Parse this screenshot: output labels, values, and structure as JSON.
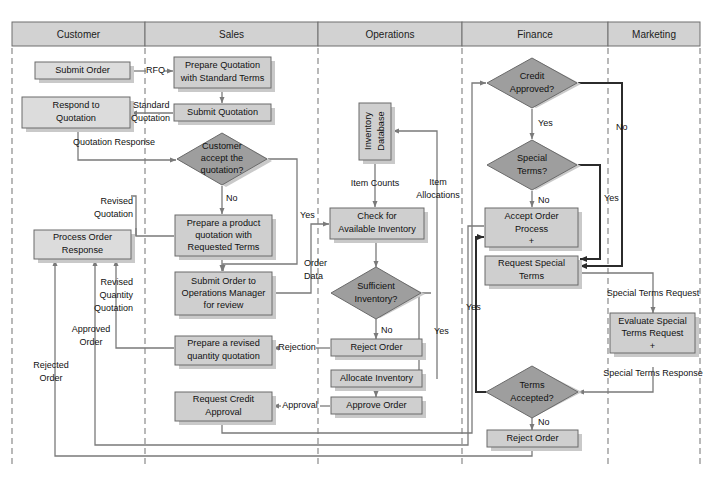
{
  "diagram": {
    "type": "swimlane-flowchart",
    "colors": {
      "lane_header_fill": "#d2d2d2",
      "process_fill": "#cfcfcf",
      "decision_fill": "#9e9e9e",
      "line": "#7a7a7a",
      "line_dark": "#2b2b2b",
      "text": "#111111"
    },
    "lanes": [
      {
        "id": "customer",
        "label": "Customer"
      },
      {
        "id": "sales",
        "label": "Sales"
      },
      {
        "id": "operations",
        "label": "Operations"
      },
      {
        "id": "finance",
        "label": "Finance"
      },
      {
        "id": "marketing",
        "label": "Marketing"
      }
    ],
    "nodes": {
      "submit_order": {
        "lane": "customer",
        "shape": "process",
        "lines": [
          "Submit Order"
        ]
      },
      "respond_quotation": {
        "lane": "customer",
        "shape": "process",
        "lines": [
          "Respond to",
          "Quotation"
        ]
      },
      "process_order_resp": {
        "lane": "customer",
        "shape": "process",
        "lines": [
          "Process Order",
          "Response"
        ]
      },
      "prepare_quotation": {
        "lane": "sales",
        "shape": "process",
        "lines": [
          "Prepare Quotation",
          "with Standard Terms"
        ]
      },
      "submit_quotation": {
        "lane": "sales",
        "shape": "process",
        "lines": [
          "Submit Quotation"
        ]
      },
      "customer_accept": {
        "lane": "sales",
        "shape": "decision",
        "lines": [
          "Customer",
          "accept the",
          "quotation?"
        ]
      },
      "prepare_product_q": {
        "lane": "sales",
        "shape": "process",
        "lines": [
          "Prepare a product",
          "quotation with",
          "Requested Terms"
        ]
      },
      "submit_order_ops": {
        "lane": "sales",
        "shape": "process",
        "lines": [
          "Submit Order to",
          "Operations Manager",
          "for review"
        ]
      },
      "prepare_revised_q": {
        "lane": "sales",
        "shape": "process",
        "lines": [
          "Prepare a revised",
          "quantity quotation"
        ]
      },
      "request_credit": {
        "lane": "sales",
        "shape": "process",
        "lines": [
          "Request Credit",
          "Approval"
        ]
      },
      "inventory_db": {
        "lane": "operations",
        "shape": "process-vertical",
        "lines": [
          "Inventory",
          "Database"
        ]
      },
      "check_inventory": {
        "lane": "operations",
        "shape": "process",
        "lines": [
          "Check for",
          "Available Inventory"
        ]
      },
      "sufficient_inv": {
        "lane": "operations",
        "shape": "decision",
        "lines": [
          "Sufficient",
          "Inventory?"
        ]
      },
      "reject_order_ops": {
        "lane": "operations",
        "shape": "process",
        "lines": [
          "Reject Order"
        ]
      },
      "allocate_inventory": {
        "lane": "operations",
        "shape": "process",
        "lines": [
          "Allocate Inventory"
        ]
      },
      "approve_order": {
        "lane": "operations",
        "shape": "process",
        "lines": [
          "Approve Order"
        ]
      },
      "credit_approved": {
        "lane": "finance",
        "shape": "decision",
        "lines": [
          "Credit",
          "Approved?"
        ]
      },
      "special_terms": {
        "lane": "finance",
        "shape": "decision",
        "lines": [
          "Special",
          "Terms?"
        ]
      },
      "accept_order_proc": {
        "lane": "finance",
        "shape": "process",
        "lines": [
          "Accept Order",
          "Process",
          "+"
        ]
      },
      "request_special": {
        "lane": "finance",
        "shape": "process",
        "lines": [
          "Request Special",
          "Terms"
        ]
      },
      "terms_accepted": {
        "lane": "finance",
        "shape": "decision",
        "lines": [
          "Terms",
          "Accepted?"
        ]
      },
      "reject_order_fin": {
        "lane": "finance",
        "shape": "process",
        "lines": [
          "Reject Order"
        ]
      },
      "evaluate_special": {
        "lane": "marketing",
        "shape": "process",
        "lines": [
          "Evaluate Special",
          "Terms Request",
          "+"
        ]
      }
    },
    "edge_labels": {
      "rfq": "RFQ",
      "standard_quotation_1": "Standard",
      "standard_quotation_2": "Quotation",
      "quotation_response": "Quotation Response",
      "revised_quotation_1": "Revised",
      "revised_quotation_2": "Quotation",
      "no_customer_accept": "No",
      "yes_customer_accept": "Yes",
      "order_data_1": "Order",
      "order_data_2": "Data",
      "item_counts": "Item Counts",
      "item_allocations_1": "Item",
      "item_allocations_2": "Allocations",
      "no_sufficient": "No",
      "yes_sufficient": "Yes",
      "rejection": "Rejection",
      "approval": "Approval",
      "revised_quantity_1": "Revised",
      "revised_quantity_2": "Quantity",
      "revised_quantity_3": "Quotation",
      "approved_order_1": "Approved",
      "approved_order_2": "Order",
      "rejected_order_1": "Rejected",
      "rejected_order_2": "Order",
      "yes_credit": "Yes",
      "no_credit": "No",
      "no_special": "No",
      "yes_special": "Yes",
      "yes_terms": "Yes",
      "no_terms": "No",
      "special_terms_request": "Special Terms Request",
      "special_terms_response": "Special Terms Response"
    }
  }
}
